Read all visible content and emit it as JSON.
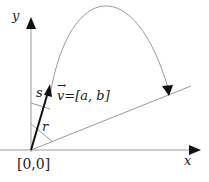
{
  "diagram": {
    "axes": {
      "x_label": "x",
      "y_label": "y",
      "origin_label": "[0,0]"
    },
    "vector": {
      "name": "v",
      "label": "v=[a, b]",
      "arrow_glyph": "→"
    },
    "segments": {
      "r_label": "r",
      "s_label": "s"
    },
    "colors": {
      "axis": "#9a9a9a",
      "vector": "#111111",
      "curve": "#9a9a9a",
      "text": "#222222"
    }
  }
}
